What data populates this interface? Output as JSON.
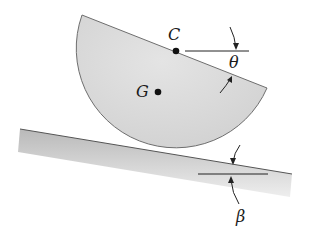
{
  "figure": {
    "labels": {
      "center": "C",
      "centroid": "G",
      "disk_angle": "θ",
      "incline_angle": "β"
    },
    "colors": {
      "disk_fill": "#d9d9d9",
      "disk_stroke": "#6e6e6e",
      "incline_fill_top": "#bdbdbd",
      "incline_fill_bottom": "#ececec",
      "line": "#222222"
    }
  }
}
